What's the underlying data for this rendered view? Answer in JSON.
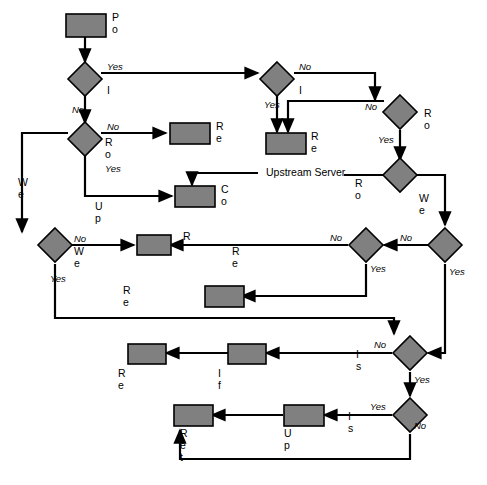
{
  "diagram": {
    "colors": {
      "node_fill": "#808080",
      "stroke": "#000000",
      "background": "#ffffff"
    },
    "nodes": {
      "policy_allows": "Policy allows\nWeb request",
      "is_object_in_cache": "Is object in cache?",
      "is_object_valid": "Is object valid?",
      "route_the_request_left": "Route the\nrequest?",
      "route_the_request_right": "Route the\nrequest?",
      "return_error_to_user_top": "Return error\nto user",
      "return_object_in_cache_top": "Return object in\ncache to user",
      "route_where": "Route\nwhere?",
      "connect_to_upstream": "Connect to\nUpstream server",
      "web_server_accessible_right": "Web server\naccessible?",
      "web_server_accessible_left": "Web server\naccessible?",
      "web_server_accessible_mid": "Web server\naccessible?",
      "return_expired_objects": "Return expired objects if\nWeb server inaccessible?",
      "return_error_to_user_mid": "Return error to user",
      "return_object_in_cache_mid": "Return object in\ncache to user",
      "return_error_to_user_low": "Return error\nto user",
      "if_applicable_negative_cache": "If applicable, create\nnegative cache object",
      "is_object_on_web_server": "Is object\non Web\nserver?",
      "is_object_cachable": "Is object\ncachable?",
      "update_cache": "Update\ncache",
      "return_object_on_web_server": "Return object\non Web server\nto user"
    },
    "edge_labels": {
      "cache_yes": "Yes",
      "cache_no": "No",
      "valid_no": "No",
      "valid_yes": "Yes",
      "route_right_no": "No",
      "route_right_yes": "Yes",
      "route_left_no": "No",
      "route_left_yes": "Yes",
      "upstream_server_line": "Upstream Server",
      "upstream_server_branch": "Upstream\nserver",
      "wsa_right_no": "No",
      "wsa_right_yes": "Yes",
      "expired_no": "No",
      "expired_yes": "Yes",
      "wsa_left_no": "No",
      "wsa_left_yes": "Yes",
      "onweb_no": "No",
      "onweb_yes": "Yes",
      "cachable_yes": "Yes",
      "cachable_no": "No"
    }
  }
}
